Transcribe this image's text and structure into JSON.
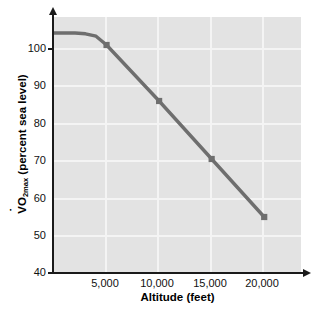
{
  "chart_data": {
    "type": "line",
    "title": "",
    "subtitle": "",
    "xlabel": "Altitude (feet)",
    "ylabel": "V̇O2max (percent sea level)",
    "ylabel_prefix": "V",
    "ylabel_main": "O",
    "ylabel_sub": "2max",
    "ylabel_suffix": " (percent sea level)",
    "x": [
      0,
      1000,
      2000,
      3000,
      4000,
      5000,
      10000,
      15000,
      20000
    ],
    "values": [
      100,
      100,
      100,
      99.8,
      99.2,
      97.0,
      83.0,
      68.5,
      54.0
    ],
    "markers": [
      {
        "x": 5000,
        "y": 97.0
      },
      {
        "x": 10000,
        "y": 83.0
      },
      {
        "x": 15000,
        "y": 68.5
      },
      {
        "x": 20000,
        "y": 54.0
      }
    ],
    "xlim": [
      0,
      23500
    ],
    "ylim": [
      40,
      104
    ],
    "xticks": [
      5000,
      10000,
      15000,
      20000
    ],
    "xtick_labels": [
      "5,000",
      "10,000",
      "15,000",
      "20,000"
    ],
    "yticks": [
      40,
      50,
      60,
      70,
      80,
      90,
      100
    ],
    "ytick_labels": [
      "40",
      "50",
      "60",
      "70",
      "80",
      "90",
      "100"
    ],
    "grid": true,
    "grid_color": "#f4f4f4",
    "plot_background": "#e3e3e3",
    "line_color": "#6e6e6e",
    "marker_color": "#6e6e6e",
    "marker_shape": "square",
    "axis_color": "#1a1a1a",
    "legend": null,
    "legend_position": "none"
  }
}
